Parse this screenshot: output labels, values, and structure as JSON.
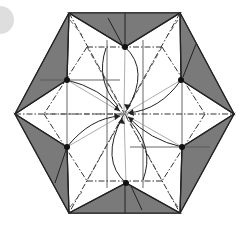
{
  "diagram": {
    "type": "origami-crease-pattern",
    "shape": "hexagon",
    "colors": {
      "background": "#ffffff",
      "flap_fill": "#7a7a7a",
      "paper_fill": "#ffffff",
      "outline": "#222222",
      "crease": "#444444",
      "light_line": "#999999",
      "dot": "#111111",
      "step_circle": "#dedede"
    },
    "step_marker": {
      "cx": 0,
      "cy": 20,
      "r": 14
    },
    "hexagon_vertices": [
      [
        69,
        13
      ],
      [
        180,
        13
      ],
      [
        234,
        114
      ],
      [
        180,
        213
      ],
      [
        69,
        213
      ],
      [
        15,
        114
      ]
    ],
    "reference_dots": [
      [
        125,
        47
      ],
      [
        181,
        80
      ],
      [
        182,
        147
      ],
      [
        126,
        183
      ],
      [
        67,
        147
      ],
      [
        67,
        80
      ]
    ],
    "center": [
      124,
      114
    ]
  }
}
